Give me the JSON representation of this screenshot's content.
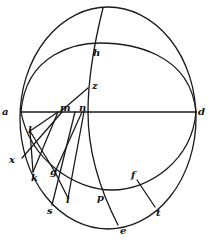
{
  "figure": {
    "type": "geometric diagram",
    "stroke_color": "#1a1a1a",
    "background": "#ffffff",
    "labels": [
      {
        "id": "a",
        "text": "a",
        "x": 2,
        "y": 107
      },
      {
        "id": "d",
        "text": "d",
        "x": 197,
        "y": 107
      },
      {
        "id": "h",
        "text": "h",
        "x": 91,
        "y": 48
      },
      {
        "id": "z",
        "text": "z",
        "x": 92,
        "y": 81
      },
      {
        "id": "m",
        "text": "m",
        "x": 61,
        "y": 103
      },
      {
        "id": "n",
        "text": "n",
        "x": 80,
        "y": 103
      },
      {
        "id": "l",
        "text": "l",
        "x": 28,
        "y": 128
      },
      {
        "id": "x",
        "text": "x",
        "x": 9,
        "y": 158
      },
      {
        "id": "k",
        "text": "k",
        "x": 31,
        "y": 174
      },
      {
        "id": "g",
        "text": "g",
        "x": 50,
        "y": 170
      },
      {
        "id": "i",
        "text": "i",
        "x": 66,
        "y": 197
      },
      {
        "id": "s",
        "text": "s",
        "x": 47,
        "y": 208
      },
      {
        "id": "p",
        "text": "p",
        "x": 97,
        "y": 196
      },
      {
        "id": "f",
        "text": "f",
        "x": 130,
        "y": 172
      },
      {
        "id": "t",
        "text": "t",
        "x": 155,
        "y": 209
      },
      {
        "id": "e",
        "text": "e",
        "x": 119,
        "y": 226
      }
    ]
  }
}
